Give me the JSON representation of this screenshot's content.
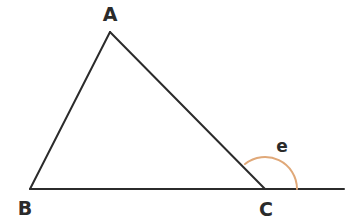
{
  "figure": {
    "kind": "triangle-with-exterior-angle",
    "background_color": "#ffffff",
    "stroke_color": "#2b2b2b",
    "stroke_width": 2,
    "arc_color": "#e0a878",
    "arc_width": 2,
    "canvas": {
      "width": 360,
      "height": 224
    },
    "vertices": [
      {
        "name": "A",
        "label": "A",
        "x": 110,
        "y": 32
      },
      {
        "name": "B",
        "label": "B",
        "x": 30,
        "y": 189
      },
      {
        "name": "C",
        "label": "C",
        "x": 265,
        "y": 189
      }
    ],
    "labels": {
      "A": "A",
      "B": "B",
      "C": "C",
      "angle_e": "e"
    },
    "segments": [
      {
        "name": "side-AB",
        "from": "A",
        "to": "B"
      },
      {
        "name": "side-AC",
        "from": "A",
        "to": "C"
      },
      {
        "name": "side-BC",
        "from": "B",
        "to": "C"
      },
      {
        "name": "extension-C-right",
        "from": "C",
        "to": "ray-end"
      }
    ],
    "baseline": {
      "x1": 30,
      "y1": 189,
      "x2": 344,
      "y2": 189
    },
    "ray_extension_end": {
      "x": 344,
      "y": 189
    },
    "angle_arc": {
      "name": "exterior-angle-e",
      "label": "e",
      "center": {
        "x": 265,
        "y": 189
      },
      "radius": 32,
      "start": {
        "x": 297,
        "y": 189
      },
      "end": {
        "x": 245,
        "y": 164
      },
      "sweep": "counterclockwise-from-baseline-to-side-AC",
      "label_position": {
        "x": 282,
        "y": 146
      }
    }
  }
}
